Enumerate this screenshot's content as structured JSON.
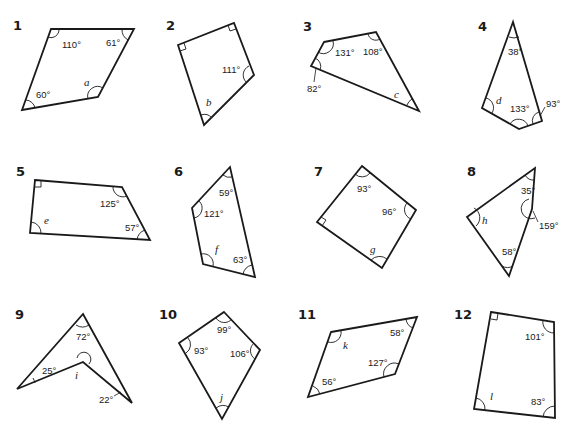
{
  "worksheet": {
    "problems": [
      {
        "number": "1",
        "angles": [
          "110°",
          "61°",
          "60°"
        ],
        "unknown": "a"
      },
      {
        "number": "2",
        "angles": [
          "111°"
        ],
        "right_angles": 2,
        "unknown": "b"
      },
      {
        "number": "3",
        "angles": [
          "131°",
          "108°",
          "82°"
        ],
        "unknown": "c"
      },
      {
        "number": "4",
        "angles": [
          "38°",
          "133°",
          "93°"
        ],
        "unknown": "d"
      },
      {
        "number": "5",
        "angles": [
          "125°",
          "57°"
        ],
        "right_angles": 1,
        "unknown": "e"
      },
      {
        "number": "6",
        "angles": [
          "59°",
          "121°",
          "63°"
        ],
        "unknown": "f"
      },
      {
        "number": "7",
        "angles": [
          "93°",
          "96°"
        ],
        "right_angles": 1,
        "unknown": "g"
      },
      {
        "number": "8",
        "angles": [
          "35°",
          "159°",
          "58°"
        ],
        "unknown": "h"
      },
      {
        "number": "9",
        "angles": [
          "72°",
          "25°",
          "22°"
        ],
        "unknown": "i"
      },
      {
        "number": "10",
        "angles": [
          "99°",
          "93°",
          "106°"
        ],
        "unknown": "j"
      },
      {
        "number": "11",
        "angles": [
          "58°",
          "127°",
          "56°"
        ],
        "unknown": "k"
      },
      {
        "number": "12",
        "angles": [
          "101°",
          "83°"
        ],
        "right_angles": 1,
        "unknown": "l"
      }
    ]
  }
}
